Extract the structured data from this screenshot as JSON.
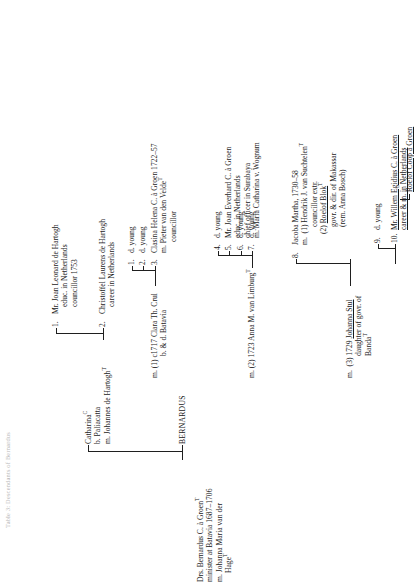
{
  "document": {
    "type": "genealogical-chart",
    "orientation": "rotated-90-ccw",
    "title_faint": "Table 3:  Descendants of Bernardus"
  },
  "progenitor": {
    "lines": [
      "Drs.  Bernardus C. à Groenᵀ",
      "minister at Batavia 1687–1706",
      "m. Johanna Maria van der",
      "Hageᵀ"
    ]
  },
  "generation2": [
    {
      "name": "Catharinaᶜ",
      "lines": [
        "b. Paliacatta",
        "m. Johannes de Hartoghᵀ"
      ],
      "children": [
        {
          "num": "1.",
          "lines": [
            "Mr.  Joan Leonard de Hartogh",
            "educ. in Netherlands",
            "councillor 1753"
          ]
        },
        {
          "num": "2.",
          "lines": [
            "Christoffel Laurens de Hartogh",
            "career in Netherlands"
          ]
        }
      ]
    },
    {
      "name": "BERNARDUS",
      "marriages": [
        {
          "label": "m.  (1) c1717 Clara Th. Crul",
          "sublines": [
            "b. & d. Batavia"
          ],
          "children": [
            {
              "num": "1.",
              "lines": [
                "d.  young"
              ]
            },
            {
              "num": "2.",
              "lines": [
                "d.  young"
              ]
            },
            {
              "num": "3.",
              "lines": [
                "Clasina Helena C. à Groen 1722–57",
                "m. Pieter van den Veldeᵀ",
                "councillor"
              ]
            }
          ]
        },
        {
          "label": "m.  (2) 1723 Anna M. van Limburgᵀ",
          "sublines": [],
          "children": [
            {
              "num": "4.",
              "lines": [
                "d.  young"
              ]
            },
            {
              "num": "5.",
              "lines": [
                "Mr. Joan Everhard C. à Groen",
                "educ. in Netherlands",
                "chief officer in Surabaya",
                "m. Maria Catharina v. Wognum"
              ]
            },
            {
              "num": "6.",
              "lines": [
                "d.  young"
              ]
            },
            {
              "num": "7.",
              "lines": [
                "d.  young"
              ]
            }
          ]
        },
        {
          "label": "m.  (3) 1729 Johanna Stul",
          "sublines": [
            "daughter of govr. of",
            "Bandaᵀ"
          ],
          "children": [
            {
              "num": "8.",
              "lines": [
                "Jacoba Martha, 1730–58",
                "m.  (1) Hendrik J. van Suchtelenᵀ",
                "councillor extr.",
                "(2) Roelof Blokᵀ",
                "govr. & dir. of Makassar",
                "(rem. Anna Bosch)"
              ]
            },
            {
              "num": "9.",
              "lines": [
                "d.  young"
              ]
            },
            {
              "num": "10.",
              "lines": [
                "Mr. Willem Egidius C. à Groen",
                "career & m. in Netherlands"
              ],
              "descendant": "Roelof Coop à Groen"
            }
          ]
        }
      ]
    }
  ],
  "colors": {
    "ink": "#1a1a1a",
    "rule": "#1f1f1f",
    "paper": "#ffffff"
  }
}
